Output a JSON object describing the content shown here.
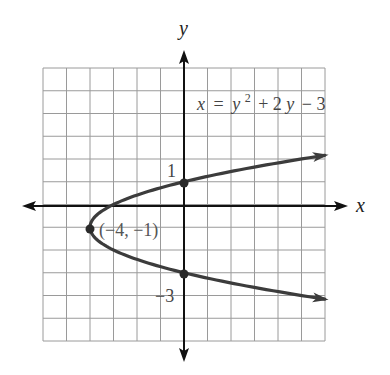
{
  "chart_data": {
    "type": "line",
    "title": "",
    "equation": {
      "lhs": "x",
      "eq": "=",
      "y": "y",
      "exp": "2",
      "rest": "+ 2",
      "y2": "y",
      "tail": "− 3",
      "full": "x = y^2 + 2y − 3"
    },
    "xlabel": "x",
    "ylabel": "y",
    "xlim": [
      -6,
      6
    ],
    "ylim": [
      -6,
      6
    ],
    "grid": true,
    "grid_step": 1,
    "series": [
      {
        "name": "x = y^2 + 2y − 3",
        "kind": "parabola-opening-right",
        "y_range": [
          -4.16,
          2.16
        ],
        "arrows_at_ends": true,
        "color": "#3c3c3c"
      }
    ],
    "points": [
      {
        "x": -4,
        "y": -1,
        "label": "(−4, −1)",
        "role": "vertex"
      },
      {
        "x": 0,
        "y": 1,
        "label": "1",
        "role": "y-intercept"
      },
      {
        "x": 0,
        "y": -3,
        "label": "−3",
        "role": "y-intercept"
      }
    ],
    "tick_labels": [
      {
        "axis": "y",
        "value": 1,
        "text": "1"
      },
      {
        "axis": "y",
        "value": -3,
        "text": "−3"
      }
    ],
    "colors": {
      "grid": "#9a9a9a",
      "axes": "#111111",
      "curve": "#3c3c3c"
    }
  }
}
